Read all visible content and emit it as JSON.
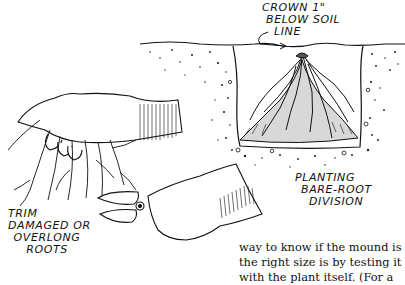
{
  "figure": {
    "labels": {
      "crown": [
        "CROWN 1\"",
        "BELOW SOIL",
        "LINE"
      ],
      "trim": [
        "TRIM",
        "DAMAGED OR",
        "OVERLONG",
        "ROOTS"
      ],
      "planting": [
        "PLANTING",
        "BARE-ROOT",
        "DIVISION"
      ]
    }
  },
  "body_text": {
    "lines": [
      "way to know if the mound is",
      "the right size is by testing it",
      "with the plant itself. (For a"
    ]
  }
}
